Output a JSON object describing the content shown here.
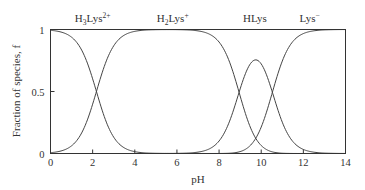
{
  "chart_data": {
    "type": "line",
    "title": "",
    "xlabel": "pH",
    "ylabel": "Fraction of species, f",
    "xlim": [
      0,
      14
    ],
    "ylim": [
      0,
      1
    ],
    "xticks": [
      0,
      2,
      4,
      6,
      8,
      10,
      12,
      14
    ],
    "yticks": [
      {
        "v": 0,
        "label": "0"
      },
      {
        "v": 0.5,
        "label": "0.5"
      },
      {
        "v": 1,
        "label": "1"
      }
    ],
    "grid": false,
    "pKa": [
      2.18,
      8.95,
      10.53
    ],
    "series": [
      {
        "name": "H3Lys2+",
        "label_main": "H",
        "label_sub": "3",
        "label_rest": "Lys",
        "label_sup": "2+",
        "label_x": 2.0
      },
      {
        "name": "H2Lys+",
        "label_main": "H",
        "label_sub": "2",
        "label_rest": "Lys",
        "label_sup": "+",
        "label_x": 5.8
      },
      {
        "name": "HLys",
        "label_main": "HLys",
        "label_sub": "",
        "label_rest": "",
        "label_sup": "",
        "label_x": 9.7
      },
      {
        "name": "Lys-",
        "label_main": "Lys",
        "label_sub": "",
        "label_rest": "",
        "label_sup": "−",
        "label_x": 12.3
      }
    ],
    "sample_points": {
      "H3Lys2+": [
        [
          0,
          0.99
        ],
        [
          2.18,
          0.5
        ],
        [
          4,
          0.01
        ]
      ],
      "H2Lys+": [
        [
          0,
          0.01
        ],
        [
          2.18,
          0.5
        ],
        [
          4,
          0.99
        ],
        [
          7,
          0.99
        ],
        [
          8.95,
          0.5
        ],
        [
          10,
          0.08
        ]
      ],
      "HLys": [
        [
          8,
          0.1
        ],
        [
          8.95,
          0.5
        ],
        [
          9.74,
          0.77
        ],
        [
          10.53,
          0.5
        ],
        [
          11.5,
          0.1
        ]
      ],
      "Lys-": [
        [
          9,
          0.01
        ],
        [
          10.53,
          0.5
        ],
        [
          12.5,
          0.99
        ],
        [
          14,
          1.0
        ]
      ]
    }
  },
  "colors": {
    "axis": "#333333",
    "curve": "#444444"
  }
}
